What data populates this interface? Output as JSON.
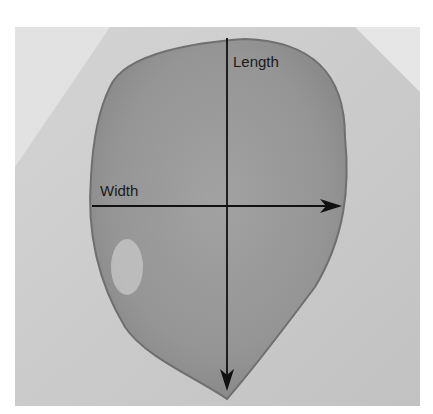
{
  "figure": {
    "labels": {
      "length": "Length",
      "width": "Width"
    },
    "axes": {
      "length_axis": {
        "orientation": "vertical",
        "arrow_direction": "down"
      },
      "width_axis": {
        "orientation": "horizontal",
        "arrow_direction": "right"
      }
    },
    "colors": {
      "background": "#ffffff",
      "skin": "#c9c9c9",
      "wound_bed": "#9a9a9a",
      "wound_edge": "#6f6f6f",
      "arrow": "#111111"
    }
  }
}
